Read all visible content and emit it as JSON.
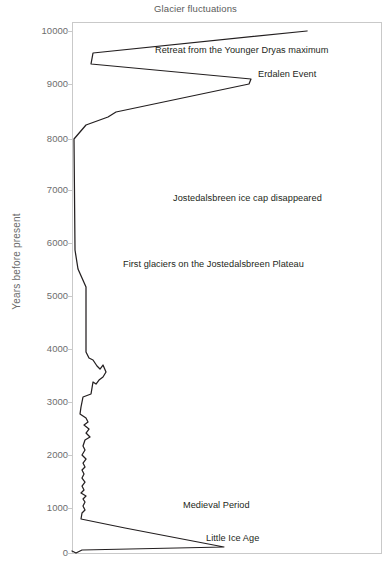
{
  "chart_data": {
    "type": "line",
    "title": "Glacier fluctuations",
    "xlabel": "",
    "ylabel": "Years before present",
    "ylim": [
      0,
      10000
    ],
    "xlim": [
      0,
      100
    ],
    "grid": false,
    "legend": null,
    "orientation": "vertical-time-axis",
    "y_ticks": [
      10000,
      9000,
      8000,
      7000,
      6000,
      5000,
      4000,
      3000,
      2000,
      1000,
      0
    ],
    "y_tick_labels": [
      "10000",
      "9000",
      "8000",
      "7000",
      "6000",
      "5000",
      "4000",
      "3000",
      "2000",
      "1000",
      "0"
    ],
    "annotations": [
      {
        "text": "Retreat from the Younger Dryas maximum",
        "x": 155,
        "y": 51
      },
      {
        "text": "Erdalen Event",
        "x": 258,
        "y": 75
      },
      {
        "text": "Jostedalsbreen ice cap disappeared",
        "x": 173,
        "y": 199
      },
      {
        "text": "First glaciers on the Jostedalsbreen Plateau",
        "x": 123,
        "y": 265
      },
      {
        "text": "Medieval Period",
        "x": 183,
        "y": 506
      },
      {
        "text": "Little Ice Age",
        "x": 206,
        "y": 539
      }
    ],
    "series": [
      {
        "name": "Glacier extent",
        "description": "Glacier front position (relative extent) plotted against years before present",
        "points_xy_px": [
          [
            307,
            31
          ],
          [
            93,
            53
          ],
          [
            91,
            64
          ],
          [
            251,
            79
          ],
          [
            249,
            84
          ],
          [
            116,
            112
          ],
          [
            108,
            117
          ],
          [
            86,
            125
          ],
          [
            74,
            139
          ],
          [
            75,
            250
          ],
          [
            78,
            269
          ],
          [
            86,
            287
          ],
          [
            86,
            352
          ],
          [
            89,
            358
          ],
          [
            93,
            360
          ],
          [
            97,
            366
          ],
          [
            100,
            369
          ],
          [
            103,
            365
          ],
          [
            106,
            372
          ],
          [
            103,
            377
          ],
          [
            99,
            380
          ],
          [
            96,
            384
          ],
          [
            93,
            382
          ],
          [
            92,
            388
          ],
          [
            91,
            394
          ],
          [
            83,
            397
          ],
          [
            81,
            407
          ],
          [
            80,
            414
          ],
          [
            86,
            418
          ],
          [
            88,
            422
          ],
          [
            84,
            425
          ],
          [
            89,
            429
          ],
          [
            86,
            433
          ],
          [
            90,
            437
          ],
          [
            85,
            440
          ],
          [
            83,
            446
          ],
          [
            85,
            450
          ],
          [
            82,
            455
          ],
          [
            86,
            459
          ],
          [
            83,
            463
          ],
          [
            85,
            467
          ],
          [
            82,
            470
          ],
          [
            84,
            474
          ],
          [
            82,
            478
          ],
          [
            85,
            482
          ],
          [
            82,
            486
          ],
          [
            84,
            490
          ],
          [
            81,
            493
          ],
          [
            86,
            496
          ],
          [
            83,
            499
          ],
          [
            85,
            502
          ],
          [
            83,
            506
          ],
          [
            85,
            510
          ],
          [
            82,
            513
          ],
          [
            81,
            519
          ],
          [
            125,
            528
          ],
          [
            224,
            547
          ],
          [
            82,
            550
          ],
          [
            76,
            553
          ],
          [
            72,
            551
          ]
        ]
      }
    ]
  },
  "axes": {
    "frame": {
      "left": 72,
      "top": 22,
      "right": 381,
      "bottom": 553
    },
    "tick_positions_px": [
      31,
      84,
      139,
      190,
      243,
      296,
      349,
      402,
      455,
      508,
      553
    ]
  },
  "colors": {
    "line": "#231f20",
    "frame": "#c9c9c9",
    "tick_label": "#6d6d6d",
    "title": "#5b5b5b",
    "background": "#ffffff"
  }
}
